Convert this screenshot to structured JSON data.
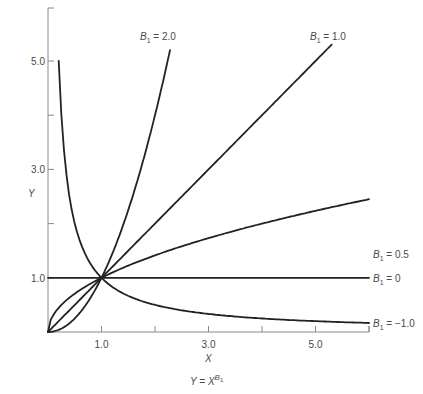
{
  "chart_data": {
    "type": "line",
    "title": "",
    "caption": "Y = X^B1",
    "caption_parts": {
      "lhs": "Y = X",
      "exp": "B",
      "exp_sub": "1"
    },
    "xlabel": "X",
    "ylabel": "Y",
    "xlim": [
      0,
      6
    ],
    "ylim": [
      0,
      6
    ],
    "x_ticks": [
      1.0,
      2.0,
      3.0,
      4.0,
      5.0,
      6.0
    ],
    "x_tick_labels": [
      "1.0",
      "3.0",
      "5.0"
    ],
    "x_tick_labels_at": [
      1.0,
      3.0,
      5.0
    ],
    "y_ticks": [
      1.0,
      2.0,
      3.0,
      4.0,
      5.0
    ],
    "y_tick_labels": [
      "1.0",
      "3.0",
      "5.0"
    ],
    "y_tick_labels_at": [
      1.0,
      3.0,
      5.0
    ],
    "grid": false,
    "legend": "inline labels at curve ends",
    "series": [
      {
        "name": "B1 = 2.0",
        "exponent": 2.0,
        "x_range": [
          0,
          2.28
        ],
        "label": "B",
        "label_sub": "1",
        "label_rest": " = 2.0"
      },
      {
        "name": "B1 = 1.0",
        "exponent": 1.0,
        "x_range": [
          0,
          5.3
        ],
        "label": "B",
        "label_sub": "1",
        "label_rest": " = 1.0"
      },
      {
        "name": "B1 = 0.5",
        "exponent": 0.5,
        "x_range": [
          0,
          6.0
        ],
        "label": "B",
        "label_sub": "1",
        "label_rest": " = 0.5"
      },
      {
        "name": "B1 = 0",
        "exponent": 0.0,
        "x_range": [
          0,
          6.0
        ],
        "label": "B",
        "label_sub": "1",
        "label_rest": " = 0"
      },
      {
        "name": "B1 = -1.0",
        "exponent": -1.0,
        "x_range": [
          0.2,
          6.0
        ],
        "label": "B",
        "label_sub": "1",
        "label_rest": " = −1.0"
      }
    ],
    "sample_points": {
      "B1 = 2.0": {
        "x": [
          0,
          0.5,
          1.0,
          1.5,
          2.0,
          2.28
        ],
        "y": [
          0,
          0.25,
          1.0,
          2.25,
          4.0,
          5.2
        ]
      },
      "B1 = 1.0": {
        "x": [
          0,
          1.0,
          3.0,
          5.3
        ],
        "y": [
          0,
          1.0,
          3.0,
          5.3
        ]
      },
      "B1 = 0.5": {
        "x": [
          0,
          1.0,
          2.0,
          4.0,
          6.0
        ],
        "y": [
          0,
          1.0,
          1.41,
          2.0,
          2.45
        ]
      },
      "B1 = 0": {
        "x": [
          0,
          6.0
        ],
        "y": [
          1.0,
          1.0
        ]
      },
      "B1 = -1.0": {
        "x": [
          0.2,
          0.5,
          1.0,
          2.0,
          4.0,
          6.0
        ],
        "y": [
          5.0,
          2.0,
          1.0,
          0.5,
          0.25,
          0.17
        ]
      }
    }
  }
}
